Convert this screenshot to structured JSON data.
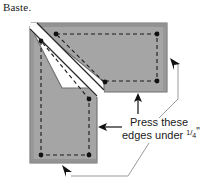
{
  "figure": {
    "title": "Baste.",
    "annotation": {
      "line1": "Press these",
      "line2_prefix": "edges under ",
      "fraction_numerator": "1",
      "fraction_denominator": "4",
      "line2_suffix": "\""
    },
    "colors": {
      "fabric_fill": "#a5a5a5",
      "fabric_edge": "#8a8a8a",
      "outline": "#1a1a1a",
      "stitch_line": "#1a1a1a",
      "gap": "#ffffff",
      "leader_line": "#9a9a9a",
      "background": "#ffffff",
      "text": "#1a1a1a"
    },
    "shape": {
      "description": "L-shaped fabric piece with diagonal mitered seam",
      "horizontal_arm_label": "upper horizontal arm",
      "vertical_arm_label": "left vertical arm",
      "corner_dot_count": 6,
      "stitch_style": "dashed"
    },
    "arrows": [
      {
        "name": "right-edge-arrow",
        "direction": "up-left"
      },
      {
        "name": "bottom-edge-arrow",
        "direction": "up"
      },
      {
        "name": "vertical-arm-right-edge-arrow",
        "direction": "left"
      },
      {
        "name": "bottom-left-arrow",
        "direction": "up-left"
      }
    ]
  }
}
